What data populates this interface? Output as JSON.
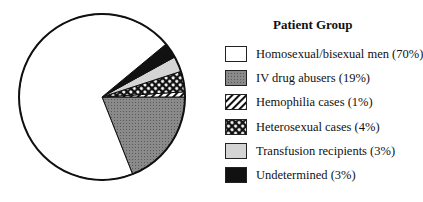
{
  "legend": {
    "title": "Patient Group",
    "items": [
      {
        "label": "Homosexual/bisexual men (70%)",
        "pattern": "white"
      },
      {
        "label": "IV drug abusers (19%)",
        "pattern": "dots"
      },
      {
        "label": "Hemophilia cases (1%)",
        "pattern": "diagonal"
      },
      {
        "label": "Heterosexual cases (4%)",
        "pattern": "crosshatch"
      },
      {
        "label": "Transfusion recipients (3%)",
        "pattern": "lightgray"
      },
      {
        "label": "Undetermined (3%)",
        "pattern": "black"
      }
    ]
  },
  "chart_data": {
    "type": "pie",
    "title": "Patient Group",
    "categories": [
      "Homosexual/bisexual men",
      "IV drug abusers",
      "Hemophilia cases",
      "Heterosexual cases",
      "Transfusion recipients",
      "Undetermined"
    ],
    "values": [
      70,
      19,
      1,
      4,
      3,
      3
    ],
    "unit": "%",
    "legend_position": "right"
  }
}
